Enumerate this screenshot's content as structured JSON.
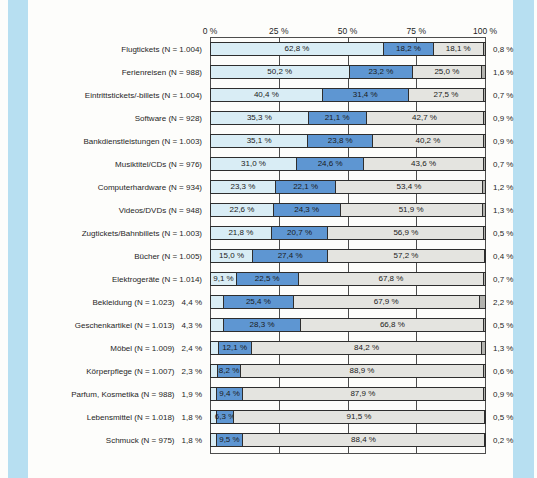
{
  "page": {
    "margin_strip_color": "#b7dff1",
    "bar_border_color": "#2e2e2e",
    "text_color": "#1f1f1f"
  },
  "chart_data": {
    "type": "bar",
    "orientation": "horizontal-stacked",
    "title": "",
    "xlabel": "",
    "ylabel": "",
    "grid": "vertical ticks at 25% steps",
    "legend": "none visible",
    "x_axis": {
      "position": "top",
      "range": [
        0,
        100
      ],
      "ticks": [
        "0 %",
        "25 %",
        "50 %",
        "75 %",
        "100 %"
      ]
    },
    "segment_colors": [
      "#d9edf5",
      "#5e96d2",
      "#e4e4e0",
      "#b3b3af"
    ],
    "rows": [
      {
        "category": "Flugtickets (N = 1.004)",
        "values": [
          62.8,
          18.2,
          18.1,
          0.8
        ],
        "segment_labels": [
          "62,8 %",
          "18,2 %",
          "18,1 %"
        ],
        "outside_left_label": null,
        "outside_right_label": "0,8 %"
      },
      {
        "category": "Ferienreisen (N = 988)",
        "values": [
          50.2,
          23.2,
          25.0,
          1.6
        ],
        "segment_labels": [
          "50,2 %",
          "23,2 %",
          "25,0 %"
        ],
        "outside_left_label": null,
        "outside_right_label": "1,6 %"
      },
      {
        "category": "Eintrittstickets/-billets (N = 1.004)",
        "values": [
          40.4,
          31.4,
          27.5,
          0.7
        ],
        "segment_labels": [
          "40,4 %",
          "31,4 %",
          "27,5 %"
        ],
        "outside_left_label": null,
        "outside_right_label": "0,7 %"
      },
      {
        "category": "Software (N = 928)",
        "values": [
          35.3,
          21.1,
          42.7,
          0.9
        ],
        "segment_labels": [
          "35,3 %",
          "21,1 %",
          "42,7 %"
        ],
        "outside_left_label": null,
        "outside_right_label": "0,9 %"
      },
      {
        "category": "Bankdienstleistungen (N = 1.003)",
        "values": [
          35.1,
          23.8,
          40.2,
          0.9
        ],
        "segment_labels": [
          "35,1 %",
          "23,8 %",
          "40,2 %"
        ],
        "outside_left_label": null,
        "outside_right_label": "0,9 %"
      },
      {
        "category": "Musiktitel/CDs (N = 976)",
        "values": [
          31.0,
          24.6,
          43.6,
          0.7
        ],
        "segment_labels": [
          "31,0 %",
          "24,6 %",
          "43,6 %"
        ],
        "outside_left_label": null,
        "outside_right_label": "0,7 %"
      },
      {
        "category": "Computerhardware (N = 934)",
        "values": [
          23.3,
          22.1,
          53.4,
          1.2
        ],
        "segment_labels": [
          "23,3 %",
          "22,1 %",
          "53,4 %"
        ],
        "outside_left_label": null,
        "outside_right_label": "1,2 %"
      },
      {
        "category": "Videos/DVDs (N = 948)",
        "values": [
          22.6,
          24.3,
          51.9,
          1.3
        ],
        "segment_labels": [
          "22,6 %",
          "24,3 %",
          "51,9 %"
        ],
        "outside_left_label": null,
        "outside_right_label": "1,3 %"
      },
      {
        "category": "Zugtickets/Bahnbillets (N = 1.003)",
        "values": [
          21.8,
          20.7,
          56.9,
          0.5
        ],
        "segment_labels": [
          "21,8 %",
          "20,7 %",
          "56,9 %"
        ],
        "outside_left_label": null,
        "outside_right_label": "0,5 %"
      },
      {
        "category": "Bücher (N = 1.005)",
        "values": [
          15.0,
          27.4,
          57.2,
          0.4
        ],
        "segment_labels": [
          "15,0 %",
          "27,4 %",
          "57,2 %"
        ],
        "outside_left_label": null,
        "outside_right_label": "0,4 %"
      },
      {
        "category": "Elektrogeräte (N = 1.014)",
        "values": [
          9.1,
          22.5,
          67.8,
          0.7
        ],
        "segment_labels": [
          "9,1 %",
          "22,5 %",
          "67,8 %"
        ],
        "outside_left_label": null,
        "outside_right_label": "0,7 %"
      },
      {
        "category": "Bekleidung (N = 1.023)",
        "values": [
          4.4,
          25.4,
          67.9,
          2.2
        ],
        "segment_labels": [
          null,
          "25,4 %",
          "67,9 %"
        ],
        "outside_left_label": "4,4 %",
        "outside_right_label": "2,2 %"
      },
      {
        "category": "Geschenkartikel (N = 1.013)",
        "values": [
          4.3,
          28.3,
          66.8,
          0.5
        ],
        "segment_labels": [
          null,
          "28,3 %",
          "66,8 %"
        ],
        "outside_left_label": "4,3 %",
        "outside_right_label": "0,5 %"
      },
      {
        "category": "Möbel (N = 1.009)",
        "values": [
          2.4,
          12.1,
          84.2,
          1.3
        ],
        "segment_labels": [
          null,
          "12,1 %",
          "84,2 %"
        ],
        "outside_left_label": "2,4 %",
        "outside_right_label": "1,3 %"
      },
      {
        "category": "Körperpflege (N = 1.007)",
        "values": [
          2.3,
          8.2,
          88.9,
          0.6
        ],
        "segment_labels": [
          null,
          "8,2 %",
          "88,9 %"
        ],
        "outside_left_label": "2,3 %",
        "outside_right_label": "0,6 %"
      },
      {
        "category": "Parfum, Kosmetika (N = 988)",
        "values": [
          1.9,
          9.4,
          87.9,
          0.9
        ],
        "segment_labels": [
          null,
          "9,4 %",
          "87,9 %"
        ],
        "outside_left_label": "1,9 %",
        "outside_right_label": "0,9 %"
      },
      {
        "category": "Lebensmittel (N = 1.018)",
        "values": [
          1.8,
          6.3,
          91.5,
          0.5
        ],
        "segment_labels": [
          null,
          "6,3 %",
          "91,5 %"
        ],
        "outside_left_label": "1,8 %",
        "outside_right_label": "0,5 %"
      },
      {
        "category": "Schmuck (N = 975)",
        "values": [
          1.8,
          9.5,
          88.4,
          0.2
        ],
        "segment_labels": [
          null,
          "9,5 %",
          "88,4 %"
        ],
        "outside_left_label": "1,8 %",
        "outside_right_label": "0,2 %"
      }
    ]
  }
}
